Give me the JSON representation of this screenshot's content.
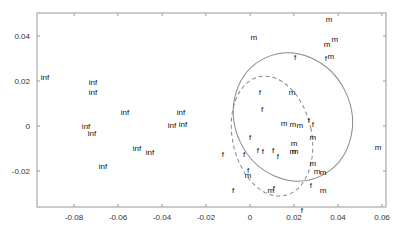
{
  "chart_data": {
    "type": "scatter",
    "title": "",
    "xlabel": "",
    "ylabel": "",
    "xlim": [
      -0.098,
      0.062
    ],
    "ylim": [
      -0.036,
      0.05
    ],
    "grid": false,
    "legend": null,
    "x_ticks": [
      "-0.08",
      "-0.06",
      "-0.04",
      "-0.02",
      "0",
      "0.02",
      "0.04",
      "0.06"
    ],
    "x_tick_values": [
      -0.08,
      -0.06,
      -0.04,
      -0.02,
      0,
      0.02,
      0.04,
      0.06
    ],
    "y_ticks": [
      "0.04",
      "0.02",
      "0",
      "-0.02"
    ],
    "y_tick_values": [
      0.04,
      0.02,
      0,
      -0.02
    ],
    "series": [
      {
        "name": "inf",
        "marker": "text",
        "points": [
          {
            "label": "inf",
            "x": -0.0932,
            "y": 0.0218
          },
          {
            "label": "inf",
            "x": -0.0714,
            "y": 0.0196
          },
          {
            "label": "inf",
            "x": -0.0714,
            "y": 0.0151
          },
          {
            "label": "inf",
            "x": -0.0568,
            "y": 0.0062
          },
          {
            "label": "inf",
            "x": -0.0314,
            "y": 0.0062
          },
          {
            "label": "inf",
            "x": -0.0745,
            "y": 0.0
          },
          {
            "label": "inf",
            "x": -0.0718,
            "y": -0.0031
          },
          {
            "label": "inf",
            "x": -0.0355,
            "y": 0.0004
          },
          {
            "label": "inf",
            "x": -0.0305,
            "y": 0.0009
          },
          {
            "label": "inf",
            "x": -0.0514,
            "y": -0.0098
          },
          {
            "label": "inf",
            "x": -0.0455,
            "y": -0.0116
          },
          {
            "label": "inf",
            "x": -0.0668,
            "y": -0.0178
          }
        ]
      },
      {
        "name": "m",
        "marker": "text",
        "points": [
          {
            "label": "m",
            "x": 0.0359,
            "y": 0.0476
          },
          {
            "label": "m",
            "x": 0.0018,
            "y": 0.0396
          },
          {
            "label": "m",
            "x": 0.0386,
            "y": 0.0387
          },
          {
            "label": "m",
            "x": 0.035,
            "y": 0.0364
          },
          {
            "label": "m",
            "x": 0.0368,
            "y": 0.0311
          },
          {
            "label": "m",
            "x": 0.0191,
            "y": 0.0151
          },
          {
            "label": "m",
            "x": 0.0155,
            "y": 0.0013
          },
          {
            "label": "m",
            "x": 0.0195,
            "y": 0.0009
          },
          {
            "label": "m",
            "x": 0.0227,
            "y": 0.0004
          },
          {
            "label": "m",
            "x": 0.0286,
            "y": -0.0049
          },
          {
            "label": "m",
            "x": 0.02,
            "y": -0.0076
          },
          {
            "label": "m",
            "x": 0.0195,
            "y": -0.0111
          },
          {
            "label": "m",
            "x": 0.0205,
            "y": -0.0111
          },
          {
            "label": "m",
            "x": 0.0286,
            "y": -0.0165
          },
          {
            "label": "m",
            "x": 0.0305,
            "y": -0.02
          },
          {
            "label": "m",
            "x": 0.0332,
            "y": -0.0204
          },
          {
            "label": "m",
            "x": -0.0009,
            "y": -0.0218
          },
          {
            "label": "m",
            "x": 0.0095,
            "y": -0.0284
          },
          {
            "label": "m",
            "x": 0.0332,
            "y": -0.0284
          },
          {
            "label": "m",
            "x": 0.0582,
            "y": -0.0093
          }
        ]
      },
      {
        "name": "f",
        "marker": "text",
        "points": [
          {
            "label": "f",
            "x": 0.0205,
            "y": 0.0307
          },
          {
            "label": "f",
            "x": 0.0345,
            "y": 0.0302
          },
          {
            "label": "f",
            "x": 0.0045,
            "y": 0.0151
          },
          {
            "label": "f",
            "x": 0.0055,
            "y": 0.0076
          },
          {
            "label": "f",
            "x": 0.0268,
            "y": 0.0027
          },
          {
            "label": "f",
            "x": 0.0286,
            "y": 0.0009
          },
          {
            "label": "f",
            "x": 0.0,
            "y": -0.0049
          },
          {
            "label": "f",
            "x": 0.0059,
            "y": -0.0111
          },
          {
            "label": "f",
            "x": 0.0036,
            "y": -0.0107
          },
          {
            "label": "f",
            "x": 0.0105,
            "y": -0.0107
          },
          {
            "label": "f",
            "x": 0.0127,
            "y": -0.0133
          },
          {
            "label": "f",
            "x": -0.0123,
            "y": -0.0124
          },
          {
            "label": "f",
            "x": -0.0027,
            "y": -0.0124
          },
          {
            "label": "f",
            "x": -0.0009,
            "y": -0.0196
          },
          {
            "label": "f",
            "x": -0.0077,
            "y": -0.0284
          },
          {
            "label": "f",
            "x": 0.0109,
            "y": -0.0276
          },
          {
            "label": "f",
            "x": 0.0277,
            "y": -0.0262
          },
          {
            "label": "f",
            "x": 0.0236,
            "y": -0.0373
          }
        ]
      }
    ],
    "annotations": [
      {
        "type": "ellipse",
        "style": "solid",
        "cx": 0.0195,
        "cy": 0.004,
        "rx": 0.0265,
        "ry": 0.029,
        "rotation_deg": -25
      },
      {
        "type": "ellipse",
        "style": "dashed",
        "cx": 0.01,
        "cy": -0.0045,
        "rx": 0.018,
        "ry": 0.027,
        "rotation_deg": -12
      }
    ]
  }
}
